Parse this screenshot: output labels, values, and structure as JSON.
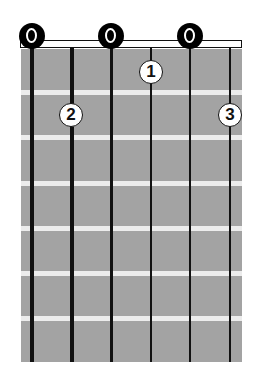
{
  "diagram": {
    "type": "guitar-chord-chart",
    "strings": 6,
    "frets_shown": 7,
    "colors": {
      "fretboard": "#a3a3a3",
      "fret_wire": "#ececec",
      "string": "#111111",
      "open_marker": "#000000",
      "finger_marker_fill": "#ffffff"
    },
    "open_strings": [
      1,
      3,
      5
    ],
    "fingers": [
      {
        "label": "1",
        "string": 4,
        "fret": 1
      },
      {
        "label": "2",
        "string": 2,
        "fret": 2
      },
      {
        "label": "3",
        "string": 6,
        "fret": 2
      }
    ]
  }
}
